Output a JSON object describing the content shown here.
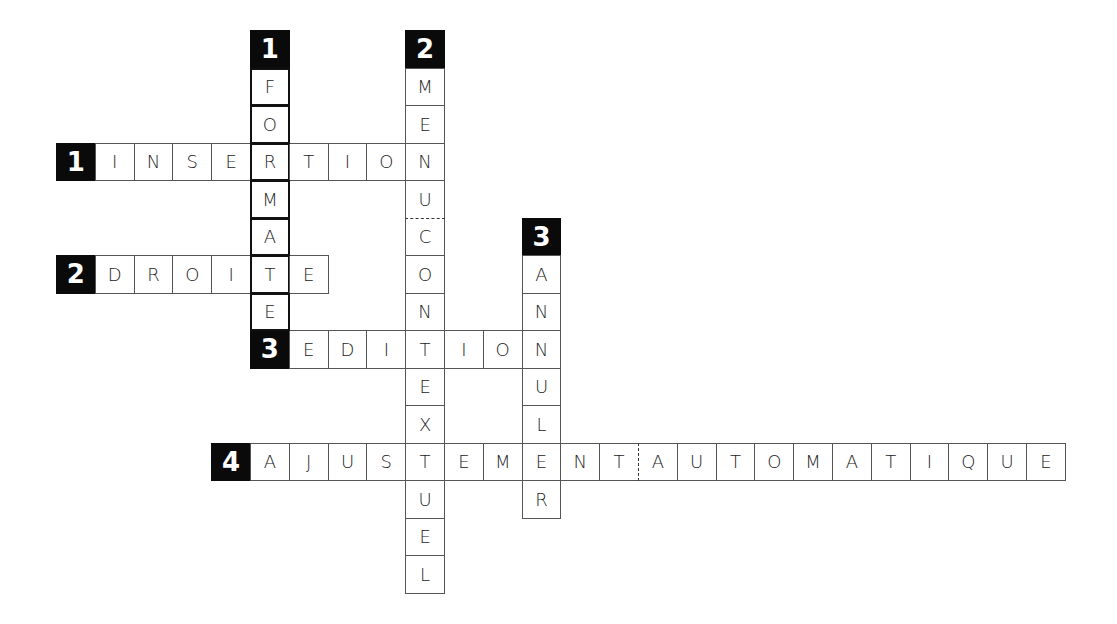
{
  "puzzle": {
    "type": "crossword",
    "grid": {
      "origin_x": 56,
      "origin_y": 30,
      "cell_w": 38.8,
      "cell_h": 37.5
    },
    "colors": {
      "number_bg": "#0a0a0a",
      "number_fg": "#ffffff",
      "cell_border": "#555555",
      "highlight_border": "#111111"
    },
    "across": [
      {
        "number": "1",
        "answer": "INSERTION",
        "row": 3,
        "col": 1
      },
      {
        "number": "2",
        "answer": "DROITE",
        "row": 6,
        "col": 1
      },
      {
        "number": "3",
        "answer": "EDITION",
        "row": 8,
        "col": 6
      },
      {
        "number": "4",
        "answer": "AJUSTEMENTAUTOMATIQUE",
        "row": 11,
        "col": 5,
        "dashed_before_index": 10
      }
    ],
    "down": [
      {
        "number": "1",
        "answer": "FORMATE",
        "row": 1,
        "col": 5,
        "thick": true
      },
      {
        "number": "2",
        "answer": "MENUCONTEXTUEL",
        "row": 1,
        "col": 9,
        "dashed_before_index": 4
      },
      {
        "number": "3",
        "answer": "ANNULER",
        "row": 6,
        "col": 12
      }
    ]
  }
}
